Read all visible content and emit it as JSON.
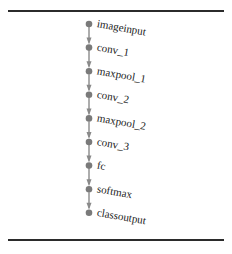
{
  "diagram": {
    "type": "layer-graph",
    "nodes": [
      {
        "id": "imageinput",
        "label": "imageinput"
      },
      {
        "id": "conv_1",
        "label": "conv_1"
      },
      {
        "id": "maxpool_1",
        "label": "maxpool_1"
      },
      {
        "id": "conv_2",
        "label": "conv_2"
      },
      {
        "id": "maxpool_2",
        "label": "maxpool_2"
      },
      {
        "id": "conv_3",
        "label": "conv_3"
      },
      {
        "id": "fc",
        "label": "fc"
      },
      {
        "id": "softmax",
        "label": "softmax"
      },
      {
        "id": "classoutput",
        "label": "classoutput"
      }
    ],
    "edges": [
      [
        "imageinput",
        "conv_1"
      ],
      [
        "conv_1",
        "maxpool_1"
      ],
      [
        "maxpool_1",
        "conv_2"
      ],
      [
        "conv_2",
        "maxpool_2"
      ],
      [
        "maxpool_2",
        "conv_3"
      ],
      [
        "conv_3",
        "fc"
      ],
      [
        "fc",
        "softmax"
      ],
      [
        "softmax",
        "classoutput"
      ]
    ],
    "colors": {
      "node": "#7a7a7a",
      "edge": "#8a8a8a",
      "text": "#222222",
      "rule": "#2b2b2b"
    }
  }
}
